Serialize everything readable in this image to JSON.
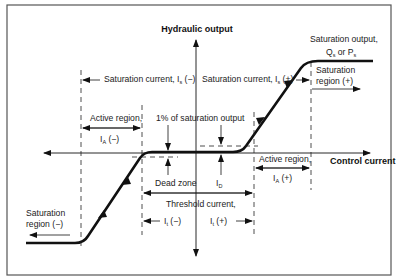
{
  "diagram": {
    "title_y_axis": "Hydraulic output",
    "title_x_axis": "Control current",
    "labels": {
      "sat_current_neg": "Saturation current, I",
      "sat_current_neg_sub": "s",
      "sat_current_neg_sign": " (−)",
      "sat_current_pos": "Saturation current, I",
      "sat_current_pos_sub": "s",
      "sat_current_pos_sign": " (+)",
      "active_region_neg_1": "Active region,",
      "active_region_neg_2": "I",
      "active_region_neg_sub": "A",
      "active_region_neg_sign": " (−)",
      "active_region_pos_1": "Active region,",
      "active_region_pos_2": "I",
      "active_region_pos_sub": "A",
      "active_region_pos_sign": " (+)",
      "one_percent": "1% of saturation output",
      "dead_zone": "Dead zone",
      "dead_zone_id": "I",
      "dead_zone_id_sub": "D",
      "threshold_current": "Threshold current,",
      "threshold_neg": "I",
      "threshold_neg_sub": "t",
      "threshold_neg_sign": " (−)",
      "threshold_pos": "I",
      "threshold_pos_sub": "t",
      "threshold_pos_sign": " (+)",
      "sat_output_1": "Saturation output,",
      "sat_output_2a": "Q",
      "sat_output_2a_sub": "s",
      "sat_output_2b": " or P",
      "sat_output_2b_sub": "s",
      "sat_region_pos_1": "Saturation",
      "sat_region_pos_2": "region (+)",
      "sat_region_neg_1": "Saturation",
      "sat_region_neg_2": "region (−)"
    },
    "colors": {
      "line": "#111111",
      "frame": "#555555",
      "text": "#222222",
      "background": "#ffffff"
    }
  }
}
